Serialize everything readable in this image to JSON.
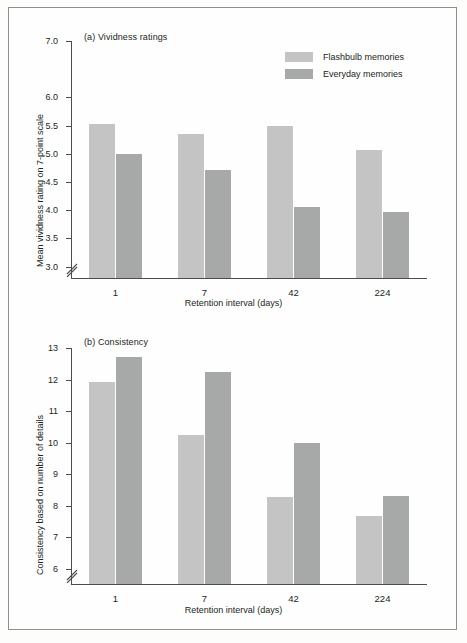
{
  "figure": {
    "legend": [
      {
        "label": "Flashbulb memories",
        "color": "#c3c4c3"
      },
      {
        "label": "Everyday memories",
        "color": "#a7a9a8"
      }
    ]
  },
  "chart_data": [
    {
      "type": "bar",
      "panel": "a",
      "title": "(a) Vividness ratings",
      "xlabel": "Retention interval (days)",
      "ylabel": "Mean vividness rating on 7-point scale",
      "categories": [
        "1",
        "7",
        "42",
        "224"
      ],
      "series": [
        {
          "name": "Flashbulb memories",
          "color": "#c3c4c3",
          "values": [
            5.52,
            5.35,
            5.49,
            5.06
          ]
        },
        {
          "name": "Everyday memories",
          "color": "#a7a9a8",
          "values": [
            4.99,
            4.72,
            4.05,
            3.97
          ]
        }
      ],
      "yticks": [
        "3.0",
        "3.5",
        "4.0",
        "4.5",
        "5.0",
        "5.5",
        "6.0",
        "7.0"
      ],
      "ytick_values": [
        3.0,
        3.5,
        4.0,
        4.5,
        5.0,
        5.5,
        6.0,
        7.0
      ],
      "ylim": [
        2.78,
        7.0
      ],
      "axis_break": true,
      "grid": false,
      "legend_position": "top-right"
    },
    {
      "type": "bar",
      "panel": "b",
      "title": "(b) Consistency",
      "xlabel": "Retention interval (days)",
      "ylabel": "Consistency based on number of details",
      "categories": [
        "1",
        "7",
        "42",
        "224"
      ],
      "series": [
        {
          "name": "Flashbulb memories",
          "color": "#c3c4c3",
          "values": [
            11.92,
            10.25,
            8.27,
            7.68
          ]
        },
        {
          "name": "Everyday memories",
          "color": "#a7a9a8",
          "values": [
            12.7,
            12.25,
            9.98,
            8.32
          ]
        }
      ],
      "yticks": [
        "6",
        "7",
        "8",
        "9",
        "10",
        "11",
        "12",
        "13"
      ],
      "ytick_values": [
        6,
        7,
        8,
        9,
        10,
        11,
        12,
        13
      ],
      "ylim": [
        5.48,
        13.0
      ],
      "axis_break": true,
      "grid": false,
      "legend_position": "none"
    }
  ]
}
